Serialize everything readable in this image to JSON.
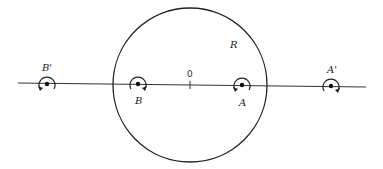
{
  "diagram": {
    "region_label": "R",
    "origin_label": "0",
    "points": [
      {
        "id": "B_prime",
        "label": "B'",
        "x": 47,
        "y": 84,
        "label_pos": "above",
        "arrow": "left-bottom"
      },
      {
        "id": "B",
        "label": "B",
        "x": 138,
        "y": 84,
        "label_pos": "below",
        "arrow": "right-bottom"
      },
      {
        "id": "A",
        "label": "A",
        "x": 242,
        "y": 85,
        "label_pos": "below",
        "arrow": "left-bottom"
      },
      {
        "id": "A_prime",
        "label": "A'",
        "x": 331,
        "y": 86,
        "label_pos": "above",
        "arrow": "right-bottom"
      }
    ],
    "circle": {
      "cx": 190,
      "cy": 85,
      "r": 77
    },
    "axis": {
      "x1": 18,
      "y1": 83,
      "x2": 366,
      "y2": 87
    },
    "colors": {
      "stroke": "#222222",
      "background": "#ffffff"
    }
  }
}
